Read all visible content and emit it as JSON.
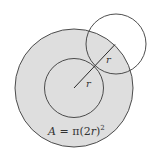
{
  "diagram": {
    "colors": {
      "fill": "#dedede",
      "stroke": "#3a3a3a",
      "background": "#ffffff"
    },
    "outer_circle": {
      "cx": 74,
      "cy": 88,
      "r": 59,
      "label": ""
    },
    "inner_circle": {
      "cx": 74,
      "cy": 88,
      "r": 29.5
    },
    "small_circle": {
      "cx": 116,
      "cy": 44,
      "r": 30
    },
    "radius_labels": [
      {
        "text": "r",
        "x": 86,
        "y": 86
      },
      {
        "text": "r",
        "x": 106,
        "y": 63
      }
    ],
    "formula": {
      "lhs": "A",
      "eq": " = π(2",
      "var": "r",
      "close": ")",
      "exp": "2"
    }
  }
}
